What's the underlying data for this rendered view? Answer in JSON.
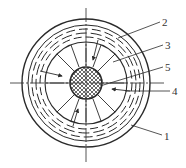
{
  "diagram": {
    "type": "cross-section",
    "labels": [
      {
        "id": "1",
        "text": "1",
        "x": 164,
        "y": 131
      },
      {
        "id": "2",
        "text": "2",
        "x": 162,
        "y": 17
      },
      {
        "id": "3",
        "text": "3",
        "x": 165,
        "y": 40
      },
      {
        "id": "4",
        "text": "4",
        "x": 172,
        "y": 86
      },
      {
        "id": "5",
        "text": "5",
        "x": 165,
        "y": 62
      }
    ],
    "colors": {
      "stroke": "#2a2a2a",
      "background": "#ffffff"
    }
  }
}
